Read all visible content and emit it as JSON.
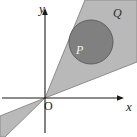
{
  "figure": {
    "background_color": "#ffffff",
    "width": 137,
    "height": 137
  },
  "axes": {
    "x_axis": {
      "label": "x",
      "icon": "arrow-right-icon",
      "color": "#1a1a1a",
      "y_pixel": 98,
      "x_start": 2,
      "x_end": 124
    },
    "y_axis": {
      "label": "y",
      "icon": "arrow-up-icon",
      "color": "#1a1a1a",
      "x_pixel": 45,
      "y_start": 133,
      "y_end": 8
    },
    "origin": {
      "label": "O",
      "x_pixel": 45,
      "y_pixel": 98
    }
  },
  "regions": [
    {
      "id": "wedge",
      "label": "Q",
      "description": "double cone / wedge through the origin, shaded light grey",
      "fill_color": "#b9b9b9",
      "stroke_color": "#8c8c8c",
      "upper_sector_points": "45,98 85,0 137,0 137,62",
      "lower_sector_points": "45,98 5,137 0,137 0,116",
      "label_position": {
        "x": 113,
        "y": 7
      }
    },
    {
      "id": "disc",
      "label": "P",
      "description": "filled circle inscribed in the upper wedge, shaded dark grey",
      "fill_color": "#808080",
      "stroke_color": "#5e5e5e",
      "center": {
        "x": 91,
        "y": 42
      },
      "radius": 22,
      "label_position": {
        "x": 76,
        "y": 44
      }
    }
  ],
  "colors": {
    "background": "#ffffff",
    "wedge_fill": "#b9b9b9",
    "wedge_stroke": "#8c8c8c",
    "disc_fill": "#808080",
    "disc_stroke": "#5e5e5e",
    "axis": "#1a1a1a",
    "label_dark": "#1a1a1a",
    "label_light": "#f2f2f2"
  }
}
